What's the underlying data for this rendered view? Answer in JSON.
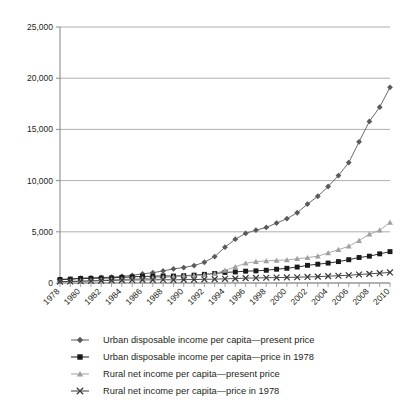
{
  "chart_data": {
    "type": "line",
    "title": "",
    "subtitle": "",
    "xlabel": "",
    "ylabel": "",
    "grid": true,
    "legend_position": "bottom",
    "xlim": [
      1978,
      2010
    ],
    "ylim": [
      0,
      25000
    ],
    "ytick_values": [
      0,
      5000,
      10000,
      15000,
      20000,
      25000
    ],
    "ytick_labels": [
      "0",
      "5,000",
      "10,000",
      "15,000",
      "20,000",
      "25,000"
    ],
    "x": [
      1978,
      1979,
      1980,
      1981,
      1982,
      1983,
      1984,
      1985,
      1986,
      1987,
      1988,
      1989,
      1990,
      1991,
      1992,
      1993,
      1994,
      1995,
      1996,
      1997,
      1998,
      1999,
      2000,
      2001,
      2002,
      2003,
      2004,
      2005,
      2006,
      2007,
      2008,
      2009,
      2010
    ],
    "xtick_labels": [
      "1978",
      "1980",
      "1982",
      "1984",
      "1986",
      "1988",
      "1990",
      "1992",
      "1994",
      "1996",
      "1998",
      "2000",
      "2002",
      "2004",
      "2006",
      "2008",
      "2010"
    ],
    "xtick_values": [
      1978,
      1980,
      1982,
      1984,
      1986,
      1988,
      1990,
      1992,
      1994,
      1996,
      1998,
      2000,
      2002,
      2004,
      2006,
      2008,
      2010
    ],
    "series": [
      {
        "name": "Urban disposable income per capita—present price",
        "marker": "diamond",
        "color": "#5a5a5a",
        "values": [
          343,
          387,
          478,
          500,
          535,
          565,
          652,
          739,
          900,
          1002,
          1181,
          1376,
          1510,
          1701,
          2027,
          2577,
          3496,
          4283,
          4839,
          5160,
          5425,
          5854,
          6280,
          6860,
          7703,
          8472,
          9422,
          10493,
          11759,
          13786,
          15781,
          17175,
          19109
        ]
      },
      {
        "name": "Urban disposable income per capita—price in 1978",
        "marker": "square",
        "color": "#1a1a1a",
        "values": [
          343,
          376,
          439,
          458,
          480,
          496,
          554,
          597,
          648,
          662,
          694,
          679,
          713,
          766,
          844,
          927,
          1034,
          1081,
          1157,
          1186,
          1244,
          1345,
          1436,
          1556,
          1723,
          1836,
          1945,
          2090,
          2276,
          2490,
          2620,
          2847,
          3064
        ]
      },
      {
        "name": "Rural net income per capita—present price",
        "marker": "triangle",
        "color": "#a0a0a0",
        "values": [
          134,
          160,
          191,
          223,
          270,
          310,
          355,
          398,
          424,
          463,
          545,
          602,
          686,
          709,
          784,
          922,
          1221,
          1578,
          1926,
          2090,
          2162,
          2210,
          2253,
          2366,
          2476,
          2622,
          2936,
          3255,
          3587,
          4140,
          4761,
          5153,
          5919
        ]
      },
      {
        "name": "Rural net income per capita—price in 1978",
        "marker": "cross",
        "color": "#3a3a3a",
        "values": [
          134,
          152,
          171,
          195,
          231,
          253,
          281,
          298,
          303,
          306,
          321,
          306,
          330,
          337,
          362,
          377,
          408,
          430,
          478,
          494,
          512,
          530,
          544,
          564,
          594,
          619,
          668,
          711,
          758,
          831,
          895,
          960,
          1030
        ]
      }
    ]
  },
  "legend": {
    "items": [
      {
        "label": "Urban disposable income per capita—present price",
        "marker": "diamond",
        "color": "#5a5a5a"
      },
      {
        "label": "Urban disposable income per capita—price in 1978",
        "marker": "square",
        "color": "#1a1a1a"
      },
      {
        "label": "Rural net income per capita—present price",
        "marker": "triangle",
        "color": "#a0a0a0"
      },
      {
        "label": "Rural net income per capita—price in 1978",
        "marker": "cross",
        "color": "#3a3a3a"
      }
    ]
  },
  "style": {
    "axis_color": "#8c8c8c",
    "grid_color": "#9a9a9a",
    "text_color": "#231f20",
    "background": "#ffffff"
  }
}
